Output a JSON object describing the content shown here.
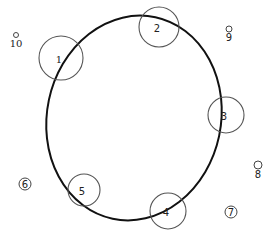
{
  "diagram": {
    "ellipse": {
      "cx": 134,
      "cy": 118,
      "rx": 87,
      "ry": 103,
      "rotate": 12,
      "stroke": "#111111",
      "stroke_width": 2
    },
    "large_circles": [
      {
        "label": "1",
        "cx": 61,
        "cy": 58,
        "r": 22
      },
      {
        "label": "2",
        "cx": 159,
        "cy": 27,
        "r": 20
      },
      {
        "label": "3",
        "cx": 226,
        "cy": 115,
        "r": 18
      },
      {
        "label": "4",
        "cx": 168,
        "cy": 211,
        "r": 18
      },
      {
        "label": "5",
        "cx": 84,
        "cy": 190,
        "r": 16
      }
    ],
    "small_markers": [
      {
        "label": "6",
        "cx": 25,
        "cy": 184,
        "r": 6,
        "style": "enclosed"
      },
      {
        "label": "7",
        "cx": 231,
        "cy": 212,
        "r": 6,
        "style": "enclosed"
      },
      {
        "label": "8",
        "cx": 258,
        "cy": 165,
        "r": 4,
        "style": "above"
      },
      {
        "label": "9",
        "cx": 229,
        "cy": 29,
        "r": 3,
        "style": "above"
      },
      {
        "label": "10",
        "cx": 16,
        "cy": 35,
        "r": 2.5,
        "style": "above"
      }
    ]
  }
}
